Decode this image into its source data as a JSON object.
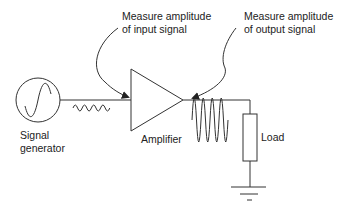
{
  "diagram": {
    "labels": {
      "signal_generator_line1": "Signal",
      "signal_generator_line2": "generator",
      "amplifier": "Amplifier",
      "load": "Load",
      "input_note_line1": "Measure amplitude",
      "input_note_line2": "of input signal",
      "output_note_line1": "Measure amplitude",
      "output_note_line2": "of output signal"
    },
    "components": [
      {
        "id": "signal-generator",
        "type": "ac-source"
      },
      {
        "id": "amplifier",
        "type": "triangle-amplifier"
      },
      {
        "id": "load",
        "type": "resistor"
      },
      {
        "id": "ground",
        "type": "ground"
      }
    ],
    "signals": {
      "input": {
        "amplitude": "small",
        "cycles": 4
      },
      "output": {
        "amplitude": "large",
        "cycles": 4
      }
    },
    "colors": {
      "line": "#333333",
      "text": "#222222",
      "background": "#ffffff"
    }
  }
}
